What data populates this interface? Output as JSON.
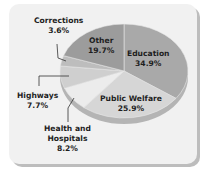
{
  "chart_data": {
    "type": "pie",
    "title": "",
    "style": "3d-tilted",
    "slices": [
      {
        "label": "Education",
        "value": 34.9,
        "display": "34.9%",
        "color": "#a9a9a9"
      },
      {
        "label": "Public Welfare",
        "value": 25.9,
        "display": "25.9%",
        "color": "#d6d6d6"
      },
      {
        "label": "Health and Hospitals",
        "value": 8.2,
        "display": "8.2%",
        "color": "#ececec"
      },
      {
        "label": "Highways",
        "value": 7.7,
        "display": "7.7%",
        "color": "#cfcfcf"
      },
      {
        "label": "Corrections",
        "value": 3.6,
        "display": "3.6%",
        "color": "#bdbdbd"
      },
      {
        "label": "Other",
        "value": 19.7,
        "display": "19.7%",
        "color": "#9c9c9c"
      }
    ],
    "legend": "none (direct labels with leader lines)"
  },
  "labels": {
    "education": {
      "name": "Education",
      "pct": "34.9%"
    },
    "welfare": {
      "name": "Public Welfare",
      "pct": "25.9%"
    },
    "health": {
      "name1": "Health and",
      "name2": "Hospitals",
      "pct": "8.2%"
    },
    "highways": {
      "name": "Highways",
      "pct": "7.7%"
    },
    "corrections": {
      "name": "Corrections",
      "pct": "3.6%"
    },
    "other": {
      "name": "Other",
      "pct": "19.7%"
    }
  }
}
